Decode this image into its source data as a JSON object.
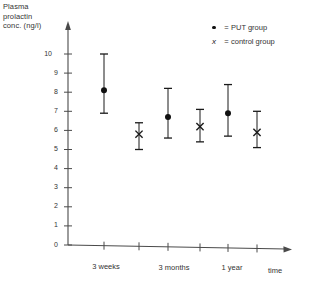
{
  "chart_data": {
    "type": "scatter",
    "title": "",
    "ylabel": "Plasma prolactin conc. (ng/l)",
    "xlabel": "time",
    "ylim": [
      0,
      10
    ],
    "y_ticks": [
      0,
      1,
      2,
      3,
      4,
      5,
      6,
      7,
      8,
      9,
      10
    ],
    "y_tick_labels": [
      "0",
      "1",
      "2",
      "3",
      "4",
      "5",
      "6",
      "7",
      "8",
      "9",
      "10"
    ],
    "grid": false,
    "error_bars": "vertical ranges with caps",
    "categories": [
      "3 weeks",
      "3 months",
      "1 year"
    ],
    "legend_position": "top-right",
    "series": [
      {
        "name": "PUT group",
        "marker": "filled-circle",
        "values": [
          8.1,
          6.7,
          6.9
        ],
        "err_low": [
          6.9,
          5.6,
          5.7
        ],
        "err_high": [
          10.0,
          8.2,
          8.4
        ]
      },
      {
        "name": "control group",
        "marker": "x",
        "values": [
          5.8,
          6.2,
          5.9
        ],
        "err_low": [
          5.0,
          5.4,
          5.1
        ],
        "err_high": [
          6.4,
          7.1,
          7.0
        ]
      }
    ]
  },
  "legend": {
    "items": [
      {
        "marker": "dot",
        "equals": "=",
        "label": "PUT group"
      },
      {
        "marker": "x",
        "equals": "=",
        "label": "control group"
      }
    ]
  },
  "axes": {
    "y_title_lines": [
      "Plasma",
      "prolactin",
      "conc.  (ng/l)"
    ],
    "x_title": "time"
  }
}
